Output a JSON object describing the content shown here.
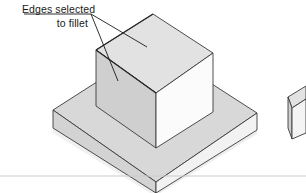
{
  "figure": {
    "type": "isometric-cad-illustration",
    "background_color": "#ffffff",
    "annotation": {
      "line1": "Edges selected",
      "line2": "to fillet",
      "text_color": "#1a1a1a",
      "leader_count": 2,
      "leader_origin": [
        92,
        13
      ],
      "leader_targets": [
        [
          147,
          47
        ],
        [
          117,
          81
        ]
      ],
      "underline": {
        "from": [
          24,
          14
        ],
        "to": [
          92,
          14
        ]
      }
    },
    "colors": {
      "outline": "#3a3a3a",
      "boss_top": "#e0e0e0",
      "boss_left": "#cfcfcf",
      "boss_right": "#fbfbfb",
      "base_top": "#d8d8d8",
      "base_left": "#d2d2d2",
      "base_right": "#f2f2f2",
      "shadow": "#eaeaea",
      "rule_line": "#cccccc"
    },
    "boss": {
      "label": "upper-rectangular-boss",
      "top_face": [
        [
          96,
          50
        ],
        [
          153,
          14
        ],
        [
          213,
          53
        ],
        [
          156,
          93
        ]
      ],
      "left_face": [
        [
          96,
          50
        ],
        [
          156,
          93
        ],
        [
          156,
          148
        ],
        [
          96,
          106
        ]
      ],
      "right_face": [
        [
          156,
          93
        ],
        [
          213,
          53
        ],
        [
          213,
          112
        ],
        [
          156,
          148
        ]
      ],
      "selected_edges": [
        {
          "name": "top-back-left-edge",
          "from": [
            96,
            50
          ],
          "to": [
            153,
            14
          ]
        },
        {
          "name": "top-front-left-edge",
          "from": [
            96,
            50
          ],
          "to": [
            156,
            93
          ]
        }
      ]
    },
    "base": {
      "label": "lower-base-plate",
      "top_face": [
        [
          53,
          110
        ],
        [
          153,
          46
        ],
        [
          257,
          113
        ],
        [
          156,
          182
        ]
      ],
      "left_face": [
        [
          53,
          110
        ],
        [
          156,
          182
        ],
        [
          156,
          193
        ],
        [
          53,
          128
        ]
      ],
      "right_face": [
        [
          156,
          182
        ],
        [
          257,
          113
        ],
        [
          257,
          130
        ],
        [
          156,
          193
        ]
      ]
    },
    "partial_shape_right": {
      "label": "adjacent-figure-fragment",
      "top_face": [
        [
          288,
          97
        ],
        [
          306,
          88
        ],
        [
          306,
          100
        ],
        [
          292,
          108
        ]
      ],
      "left_face": [
        [
          288,
          97
        ],
        [
          292,
          108
        ],
        [
          292,
          138
        ],
        [
          288,
          128
        ]
      ],
      "right_face": [
        [
          292,
          108
        ],
        [
          306,
          100
        ],
        [
          306,
          133
        ],
        [
          292,
          138
        ]
      ]
    },
    "baseline_rule": {
      "label": "page-rule-line",
      "y": 176,
      "from_x": 0,
      "to_x": 306
    }
  }
}
